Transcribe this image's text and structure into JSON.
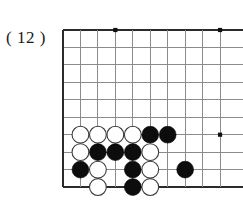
{
  "diagram": {
    "label": "( 12 )",
    "kind": "go-board-problem-diagram"
  },
  "board": {
    "origin_x": 63,
    "origin_y": 30,
    "spacing": 17.45,
    "cols": 10,
    "rows": 10,
    "left_edge_is_board_edge": true,
    "top_edge_is_board_edge": true,
    "bottom_edge_is_board_edge": true,
    "right_edge_is_cut_off": true,
    "colors": {
      "grid": "#8c8c8c",
      "edge": "#2b2b2b",
      "star": "#111111",
      "black_stone": "#0d0d0d",
      "white_stone": "#ffffff",
      "white_stone_outline": "#3a3a3a",
      "background": "#ffffff",
      "label_text": "#1a1a1a"
    },
    "stone_radius": 8.4,
    "star_radius": 2.1,
    "star_points": [
      {
        "col": 3,
        "row": 0
      },
      {
        "col": 9,
        "row": 0
      },
      {
        "col": 9,
        "row": 6
      }
    ],
    "stones": [
      {
        "col": 1,
        "row": 6,
        "color": "white"
      },
      {
        "col": 2,
        "row": 6,
        "color": "white"
      },
      {
        "col": 3,
        "row": 6,
        "color": "white"
      },
      {
        "col": 4,
        "row": 6,
        "color": "white"
      },
      {
        "col": 5,
        "row": 6,
        "color": "black"
      },
      {
        "col": 6,
        "row": 6,
        "color": "black"
      },
      {
        "col": 1,
        "row": 7,
        "color": "white"
      },
      {
        "col": 2,
        "row": 7,
        "color": "black"
      },
      {
        "col": 3,
        "row": 7,
        "color": "black"
      },
      {
        "col": 4,
        "row": 7,
        "color": "black"
      },
      {
        "col": 5,
        "row": 7,
        "color": "white"
      },
      {
        "col": 1,
        "row": 8,
        "color": "black"
      },
      {
        "col": 2,
        "row": 8,
        "color": "white"
      },
      {
        "col": 4,
        "row": 8,
        "color": "black"
      },
      {
        "col": 5,
        "row": 8,
        "color": "white"
      },
      {
        "col": 7,
        "row": 8,
        "color": "black"
      },
      {
        "col": 2,
        "row": 9,
        "color": "white"
      },
      {
        "col": 4,
        "row": 9,
        "color": "black"
      },
      {
        "col": 5,
        "row": 9,
        "color": "white"
      }
    ]
  }
}
